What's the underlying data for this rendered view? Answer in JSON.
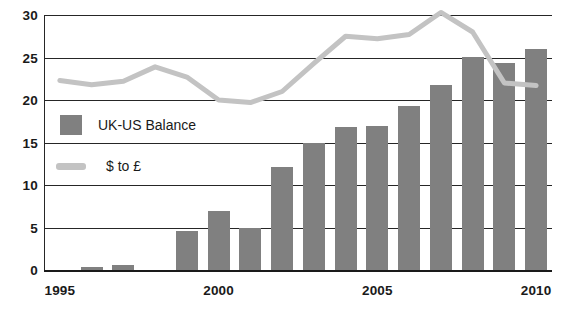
{
  "chart_data": {
    "type": "bar",
    "title": "",
    "subtitle": "",
    "xlabel": "",
    "ylabel": "",
    "xlim": [
      1995,
      2010
    ],
    "ylim": [
      0,
      30
    ],
    "yticks": [
      0,
      5,
      10,
      15,
      20,
      25,
      30
    ],
    "xticks": [
      1995,
      2000,
      2005,
      2010
    ],
    "xtick_labels": [
      "1995",
      "2000",
      "2005",
      "2010"
    ],
    "grid": true,
    "legend_position": "inside-upper-left",
    "categories": [
      1995,
      1996,
      1997,
      1998,
      1999,
      2000,
      2001,
      2002,
      2003,
      2004,
      2005,
      2006,
      2007,
      2008,
      2009,
      2010
    ],
    "series": [
      {
        "name": "UK-US Balance",
        "type": "bar",
        "color": "#808080",
        "values": [
          0,
          0.3,
          0.6,
          0,
          4.6,
          7.0,
          5.0,
          12.1,
          14.9,
          16.8,
          17.0,
          19.3,
          21.8,
          25.1,
          24.4,
          26.0
        ]
      },
      {
        "name": "$ to £",
        "type": "line",
        "color": "#c3c3c3",
        "values": [
          22.3,
          21.8,
          22.2,
          23.9,
          22.7,
          20.0,
          19.7,
          21.0,
          24.3,
          27.5,
          27.2,
          27.7,
          30.3,
          28.0,
          22.0,
          21.7
        ]
      }
    ]
  },
  "legend": {
    "items": [
      {
        "label": "UK-US Balance",
        "marker": "bar-swatch"
      },
      {
        "label": "$ to £",
        "marker": "line-swatch"
      }
    ]
  },
  "axes": {
    "y_labels": [
      "30",
      "25",
      "20",
      "15",
      "10",
      "5",
      "0"
    ],
    "x_labels": [
      "1995",
      "2000",
      "2005",
      "2010"
    ]
  },
  "colors": {
    "bar": "#808080",
    "line": "#c3c3c3",
    "grid": "#262626",
    "axis": "#1a1a1a",
    "background": "#ffffff"
  }
}
